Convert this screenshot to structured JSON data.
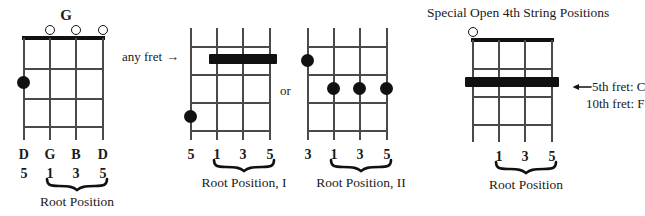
{
  "page": {
    "kind": "banjo-chord-diagrams",
    "background": "#ffffff",
    "ink": "#111111"
  },
  "headings": {
    "special_title": "Special Open 4th String Positions"
  },
  "connectors": {
    "any_fret_label": "any fret",
    "or_label": "or",
    "arrow_glyph": "→"
  },
  "diagrams": [
    {
      "id": "g-open",
      "chord_name": "G",
      "has_nut": true,
      "open_strings": [
        2,
        3,
        4
      ],
      "dots": [
        {
          "string": 1,
          "fret": 2
        }
      ],
      "barres": [],
      "note_labels": [
        "D",
        "G",
        "B",
        "D"
      ],
      "degree_labels": [
        "5",
        "1",
        "3",
        "5"
      ],
      "brace_strings": [
        2,
        3,
        4
      ],
      "caption": "Root Position"
    },
    {
      "id": "root-position-I",
      "chord_name": "",
      "has_nut": false,
      "open_strings": [],
      "dots": [
        {
          "string": 1,
          "fret": 4
        }
      ],
      "barres": [
        {
          "from_string": 2,
          "to_string": 4,
          "fret": 2
        }
      ],
      "note_labels": [],
      "degree_labels": [
        "5",
        "1",
        "3",
        "5"
      ],
      "brace_strings": [
        2,
        3,
        4
      ],
      "caption": "Root Position, I"
    },
    {
      "id": "root-position-II",
      "chord_name": "",
      "has_nut": false,
      "open_strings": [],
      "dots": [
        {
          "string": 1,
          "fret": 1
        },
        {
          "string": 2,
          "fret": 2
        },
        {
          "string": 3,
          "fret": 2
        },
        {
          "string": 4,
          "fret": 2
        }
      ],
      "barres": [],
      "note_labels": [],
      "degree_labels": [
        "3",
        "1",
        "3",
        "5"
      ],
      "brace_strings": [
        2,
        3,
        4
      ],
      "caption": "Root Position, II"
    },
    {
      "id": "special-open-4th",
      "chord_name": "",
      "has_nut": true,
      "open_strings": [
        1
      ],
      "dots": [],
      "barres": [
        {
          "from_string": 1,
          "to_string": 4,
          "fret": 2
        }
      ],
      "note_labels": [],
      "degree_labels": [
        "",
        "1",
        "3",
        "5"
      ],
      "brace_strings": [
        2,
        3,
        4
      ],
      "caption": "Root Position"
    }
  ],
  "annotations": {
    "fret_notes": [
      "5th fret: C",
      "10th fret: F"
    ]
  }
}
